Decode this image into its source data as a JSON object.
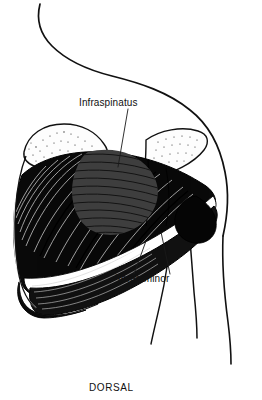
{
  "figure": {
    "kind": "anatomical-illustration",
    "view_caption": "DORSAL",
    "background_color": "#ffffff",
    "ink_color": "#111111",
    "muscle_fill_color": "#0a0a0a",
    "tendon_highlight_color": "#ffffff",
    "bone_fill_color": "#fdfdfd",
    "hatch_overlay_color": "#3a3a3a"
  },
  "labels": [
    {
      "id": "infraspinatus",
      "text": "Infraspinatus",
      "x": 79,
      "y": 106,
      "leader_from": [
        128,
        109
      ],
      "leader_to": [
        118,
        167
      ]
    },
    {
      "id": "teres-minor",
      "text": "Teres minor",
      "x": 116,
      "y": 282,
      "leader_from": [
        134,
        274
      ],
      "leader_to": [
        146,
        241
      ]
    },
    {
      "id": "teres-minor-second-leader",
      "text": "",
      "leader_from": [
        170,
        274
      ],
      "leader_to": [
        161,
        232
      ]
    }
  ],
  "caption": {
    "text": "DORSAL",
    "x": 89,
    "y": 391
  },
  "structures": [
    {
      "id": "neck-contour",
      "name": "neck and trapezius contour"
    },
    {
      "id": "deltoid-contour",
      "name": "deltoid shoulder contour"
    },
    {
      "id": "arm-contour",
      "name": "upper arm contour lines"
    },
    {
      "id": "scapula-spine",
      "name": "spine of scapula, stippled"
    },
    {
      "id": "acromion",
      "name": "acromion process, stippled"
    },
    {
      "id": "infraspinatus-muscle",
      "name": "infraspinatus muscle belly"
    },
    {
      "id": "teres-minor-muscle",
      "name": "teres minor muscle band"
    },
    {
      "id": "infraspinatus-hatch",
      "name": "infraspinatus highlighted region"
    }
  ]
}
